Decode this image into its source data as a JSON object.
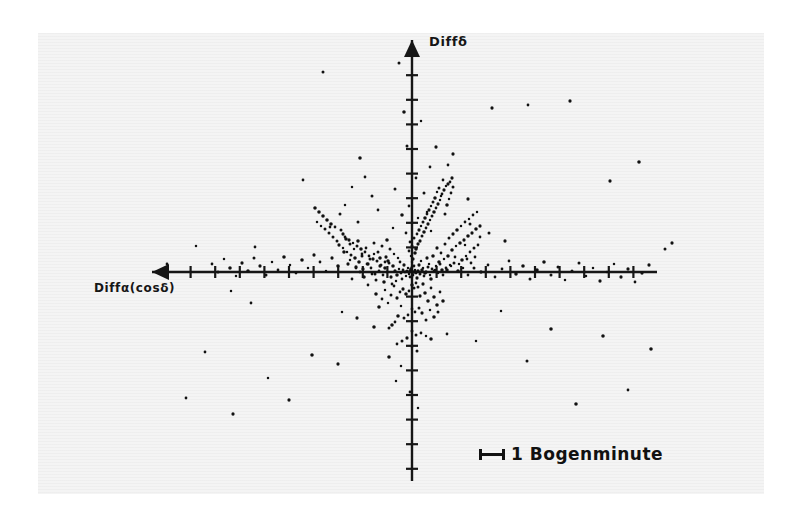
{
  "figure": {
    "background_color": "#ffffff",
    "scan_color": "#f4f4f4",
    "ink_color": "#161616"
  },
  "axes": {
    "y_label": "Diffδ",
    "x_label": "Diffα(cosδ)",
    "origin_px": [
      412,
      272
    ],
    "x_axis": {
      "start_px": 152,
      "end_px": 657,
      "arrow_at": "left",
      "tick_spacing_px": 24.6,
      "tick_half_length_px": 6
    },
    "y_axis": {
      "start_px": 40,
      "end_px": 481,
      "arrow_at": "top",
      "tick_spacing_px": 24.6,
      "tick_half_length_px": 6
    }
  },
  "legend": {
    "scale_text": "1 Bogenminute",
    "scale_bar_length_px": 26,
    "scale_bar_style": "i-beam"
  },
  "chart_data": {
    "type": "scatter",
    "title": "",
    "xlabel": "Diffα(cosδ)",
    "ylabel": "Diffδ",
    "units": "arcminutes",
    "scale_bar": {
      "label": "1 Bogenminute",
      "length_px": 26,
      "value": 1,
      "unit": "Bogenminute"
    },
    "grid": false,
    "legend_position": "bottom-right",
    "axis_direction": {
      "x": "increases to the left (arrow at left)",
      "y": "increases upward (arrow at top)"
    },
    "xlim_px": [
      152,
      657
    ],
    "ylim_px": [
      481,
      40
    ],
    "tick_spacing_px": 24.6,
    "tick_interval_value": 1,
    "n_points": 332,
    "points_px": [
      [
        412,
        272
      ],
      [
        410,
        271
      ],
      [
        414,
        272
      ],
      [
        411,
        269
      ],
      [
        415,
        270
      ],
      [
        409,
        274
      ],
      [
        413,
        275
      ],
      [
        407,
        271
      ],
      [
        416,
        273
      ],
      [
        412,
        267
      ],
      [
        405,
        272
      ],
      [
        418,
        271
      ],
      [
        410,
        277
      ],
      [
        414,
        266
      ],
      [
        408,
        268
      ],
      [
        420,
        274
      ],
      [
        403,
        270
      ],
      [
        412,
        262
      ],
      [
        417,
        278
      ],
      [
        406,
        276
      ],
      [
        422,
        270
      ],
      [
        401,
        273
      ],
      [
        413,
        259
      ],
      [
        419,
        265
      ],
      [
        404,
        265
      ],
      [
        424,
        276
      ],
      [
        399,
        269
      ],
      [
        411,
        256
      ],
      [
        421,
        261
      ],
      [
        402,
        279
      ],
      [
        426,
        272
      ],
      [
        397,
        275
      ],
      [
        415,
        253
      ],
      [
        423,
        268
      ],
      [
        400,
        262
      ],
      [
        428,
        267
      ],
      [
        395,
        271
      ],
      [
        409,
        251
      ],
      [
        425,
        273
      ],
      [
        398,
        258
      ],
      [
        430,
        275
      ],
      [
        393,
        266
      ],
      [
        416,
        249
      ],
      [
        427,
        258
      ],
      [
        396,
        281
      ],
      [
        432,
        269
      ],
      [
        391,
        277
      ],
      [
        412,
        246
      ],
      [
        429,
        264
      ],
      [
        394,
        254
      ],
      [
        434,
        271
      ],
      [
        389,
        263
      ],
      [
        418,
        244
      ],
      [
        431,
        279
      ],
      [
        392,
        284
      ],
      [
        436,
        266
      ],
      [
        387,
        272
      ],
      [
        410,
        242
      ],
      [
        433,
        256
      ],
      [
        390,
        249
      ],
      [
        438,
        273
      ],
      [
        385,
        268
      ],
      [
        420,
        241
      ],
      [
        435,
        270
      ],
      [
        388,
        261
      ],
      [
        440,
        264
      ],
      [
        383,
        275
      ],
      [
        414,
        238
      ],
      [
        437,
        248
      ],
      [
        386,
        257
      ],
      [
        442,
        270
      ],
      [
        381,
        265
      ],
      [
        422,
        236
      ],
      [
        439,
        262
      ],
      [
        384,
        282
      ],
      [
        444,
        259
      ],
      [
        379,
        271
      ],
      [
        417,
        234
      ],
      [
        441,
        253
      ],
      [
        382,
        246
      ],
      [
        446,
        268
      ],
      [
        377,
        261
      ],
      [
        424,
        232
      ],
      [
        443,
        275
      ],
      [
        380,
        266
      ],
      [
        448,
        256
      ],
      [
        375,
        274
      ],
      [
        419,
        230
      ],
      [
        445,
        244
      ],
      [
        378,
        252
      ],
      [
        450,
        265
      ],
      [
        373,
        259
      ],
      [
        426,
        228
      ],
      [
        447,
        270
      ],
      [
        376,
        280
      ],
      [
        452,
        250
      ],
      [
        371,
        268
      ],
      [
        421,
        226
      ],
      [
        449,
        238
      ],
      [
        374,
        243
      ],
      [
        454,
        263
      ],
      [
        369,
        256
      ],
      [
        428,
        224
      ],
      [
        451,
        266
      ],
      [
        372,
        274
      ],
      [
        456,
        246
      ],
      [
        367,
        264
      ],
      [
        423,
        222
      ],
      [
        453,
        234
      ],
      [
        370,
        259
      ],
      [
        458,
        271
      ],
      [
        365,
        252
      ],
      [
        430,
        220
      ],
      [
        455,
        257
      ],
      [
        368,
        285
      ],
      [
        460,
        243
      ],
      [
        363,
        269
      ],
      [
        425,
        218
      ],
      [
        457,
        230
      ],
      [
        366,
        248
      ],
      [
        462,
        260
      ],
      [
        361,
        249
      ],
      [
        432,
        216
      ],
      [
        459,
        264
      ],
      [
        364,
        277
      ],
      [
        464,
        240
      ],
      [
        359,
        262
      ],
      [
        427,
        214
      ],
      [
        461,
        226
      ],
      [
        362,
        254
      ],
      [
        466,
        256
      ],
      [
        357,
        246
      ],
      [
        434,
        212
      ],
      [
        463,
        268
      ],
      [
        360,
        272
      ],
      [
        468,
        236
      ],
      [
        355,
        258
      ],
      [
        429,
        210
      ],
      [
        465,
        222
      ],
      [
        358,
        241
      ],
      [
        470,
        252
      ],
      [
        353,
        243
      ],
      [
        436,
        208
      ],
      [
        467,
        259
      ],
      [
        356,
        267
      ],
      [
        472,
        233
      ],
      [
        351,
        255
      ],
      [
        431,
        206
      ],
      [
        469,
        219
      ],
      [
        354,
        249
      ],
      [
        474,
        248
      ],
      [
        349,
        240
      ],
      [
        438,
        204
      ],
      [
        471,
        263
      ],
      [
        352,
        279
      ],
      [
        476,
        229
      ],
      [
        347,
        252
      ],
      [
        433,
        202
      ],
      [
        473,
        215
      ],
      [
        350,
        244
      ],
      [
        478,
        245
      ],
      [
        345,
        237
      ],
      [
        440,
        200
      ],
      [
        475,
        257
      ],
      [
        348,
        264
      ],
      [
        480,
        226
      ],
      [
        343,
        248
      ],
      [
        435,
        198
      ],
      [
        477,
        212
      ],
      [
        346,
        239
      ],
      [
        441,
        196
      ],
      [
        343,
        234
      ],
      [
        442,
        194
      ],
      [
        339,
        245
      ],
      [
        437,
        192
      ],
      [
        341,
        230
      ],
      [
        444,
        190
      ],
      [
        337,
        241
      ],
      [
        439,
        188
      ],
      [
        335,
        227
      ],
      [
        446,
        186
      ],
      [
        333,
        237
      ],
      [
        448,
        184
      ],
      [
        331,
        224
      ],
      [
        450,
        182
      ],
      [
        329,
        233
      ],
      [
        443,
        180
      ],
      [
        327,
        220
      ],
      [
        452,
        178
      ],
      [
        325,
        229
      ],
      [
        445,
        214
      ],
      [
        323,
        216
      ],
      [
        447,
        205
      ],
      [
        321,
        226
      ],
      [
        449,
        199
      ],
      [
        319,
        212
      ],
      [
        451,
        193
      ],
      [
        317,
        222
      ],
      [
        453,
        187
      ],
      [
        315,
        208
      ],
      [
        412,
        285
      ],
      [
        414,
        288
      ],
      [
        409,
        291
      ],
      [
        416,
        283
      ],
      [
        406,
        294
      ],
      [
        418,
        287
      ],
      [
        403,
        289
      ],
      [
        420,
        296
      ],
      [
        400,
        292
      ],
      [
        423,
        284
      ],
      [
        397,
        298
      ],
      [
        425,
        293
      ],
      [
        394,
        286
      ],
      [
        428,
        301
      ],
      [
        391,
        295
      ],
      [
        431,
        288
      ],
      [
        388,
        303
      ],
      [
        434,
        297
      ],
      [
        385,
        290
      ],
      [
        437,
        305
      ],
      [
        382,
        299
      ],
      [
        440,
        292
      ],
      [
        379,
        307
      ],
      [
        443,
        301
      ],
      [
        376,
        294
      ],
      [
        412,
        309
      ],
      [
        415,
        312
      ],
      [
        408,
        315
      ],
      [
        419,
        308
      ],
      [
        404,
        318
      ],
      [
        422,
        313
      ],
      [
        401,
        306
      ],
      [
        426,
        320
      ],
      [
        398,
        316
      ],
      [
        430,
        310
      ],
      [
        395,
        322
      ],
      [
        434,
        317
      ],
      [
        392,
        325
      ],
      [
        438,
        312
      ],
      [
        389,
        328
      ],
      [
        412,
        331
      ],
      [
        416,
        335
      ],
      [
        407,
        338
      ],
      [
        421,
        333
      ],
      [
        402,
        341
      ],
      [
        426,
        336
      ],
      [
        397,
        344
      ],
      [
        431,
        339
      ],
      [
        412,
        347
      ],
      [
        417,
        351
      ],
      [
        385,
        262
      ],
      [
        380,
        258
      ],
      [
        374,
        254
      ],
      [
        368,
        264
      ],
      [
        362,
        256
      ],
      [
        356,
        268
      ],
      [
        350,
        260
      ],
      [
        344,
        252
      ],
      [
        338,
        266
      ],
      [
        332,
        258
      ],
      [
        326,
        271
      ],
      [
        320,
        262
      ],
      [
        314,
        255
      ],
      [
        308,
        268
      ],
      [
        302,
        260
      ],
      [
        296,
        273
      ],
      [
        290,
        265
      ],
      [
        284,
        257
      ],
      [
        278,
        270
      ],
      [
        272,
        262
      ],
      [
        266,
        275
      ],
      [
        260,
        266
      ],
      [
        254,
        258
      ],
      [
        248,
        271
      ],
      [
        242,
        263
      ],
      [
        236,
        276
      ],
      [
        230,
        268
      ],
      [
        224,
        259
      ],
      [
        218,
        272
      ],
      [
        212,
        264
      ],
      [
        468,
        275
      ],
      [
        474,
        268
      ],
      [
        481,
        272
      ],
      [
        488,
        265
      ],
      [
        495,
        277
      ],
      [
        502,
        269
      ],
      [
        509,
        261
      ],
      [
        516,
        274
      ],
      [
        523,
        266
      ],
      [
        530,
        279
      ],
      [
        537,
        270
      ],
      [
        544,
        262
      ],
      [
        551,
        275
      ],
      [
        558,
        267
      ],
      [
        565,
        280
      ],
      [
        572,
        271
      ],
      [
        579,
        263
      ],
      [
        586,
        276
      ],
      [
        593,
        268
      ],
      [
        600,
        281
      ],
      [
        607,
        272
      ],
      [
        614,
        264
      ],
      [
        621,
        277
      ],
      [
        628,
        269
      ],
      [
        635,
        282
      ],
      [
        642,
        273
      ],
      [
        649,
        265
      ],
      [
        323,
        72
      ],
      [
        360,
        158
      ],
      [
        303,
        180
      ],
      [
        255,
        247
      ],
      [
        196,
        246
      ],
      [
        167,
        264
      ],
      [
        231,
        291
      ],
      [
        251,
        303
      ],
      [
        468,
        199
      ],
      [
        492,
        108
      ],
      [
        528,
        105
      ],
      [
        570,
        101
      ],
      [
        610,
        181
      ],
      [
        639,
        162
      ],
      [
        672,
        243
      ],
      [
        665,
        249
      ],
      [
        358,
        222
      ],
      [
        330,
        227
      ],
      [
        345,
        205
      ],
      [
        372,
        196
      ],
      [
        352,
        187
      ],
      [
        378,
        210
      ],
      [
        340,
        214
      ],
      [
        365,
        177
      ],
      [
        453,
        154
      ],
      [
        465,
        245
      ],
      [
        480,
        237
      ],
      [
        470,
        224
      ],
      [
        489,
        233
      ],
      [
        505,
        241
      ],
      [
        448,
        165
      ],
      [
        436,
        147
      ],
      [
        389,
        357
      ],
      [
        401,
        366
      ],
      [
        374,
        327
      ],
      [
        357,
        318
      ],
      [
        342,
        312
      ],
      [
        396,
        381
      ],
      [
        410,
        392
      ],
      [
        418,
        408
      ],
      [
        338,
        364
      ],
      [
        312,
        355
      ],
      [
        289,
        400
      ],
      [
        268,
        378
      ],
      [
        233,
        414
      ],
      [
        205,
        352
      ],
      [
        186,
        398
      ],
      [
        447,
        334
      ],
      [
        476,
        341
      ],
      [
        501,
        311
      ],
      [
        527,
        361
      ],
      [
        551,
        329
      ],
      [
        576,
        404
      ],
      [
        603,
        336
      ],
      [
        628,
        390
      ],
      [
        651,
        349
      ],
      [
        399,
        63
      ],
      [
        404,
        112
      ],
      [
        421,
        121
      ],
      [
        407,
        146
      ],
      [
        430,
        167
      ],
      [
        416,
        178
      ],
      [
        395,
        189
      ],
      [
        424,
        193
      ],
      [
        409,
        206
      ],
      [
        402,
        215
      ],
      [
        427,
        212
      ],
      [
        418,
        218
      ],
      [
        393,
        228
      ],
      [
        406,
        233
      ],
      [
        431,
        231
      ],
      [
        387,
        240
      ]
    ]
  }
}
